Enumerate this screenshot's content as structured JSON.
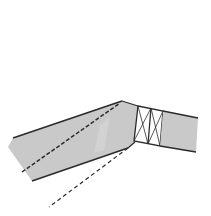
{
  "diagram": {
    "type": "technical-section",
    "width": 211,
    "height": 216,
    "colors": {
      "background": "#ffffff",
      "fill": "#c9c9c9",
      "highlight": "#d6d6d6",
      "stroke": "#2b2b2b",
      "dash": "#2b2b2b"
    },
    "shapes": {
      "angled_member": {
        "points": "13,138 122,101 138,106 135,142 128,148 32,181 8,147"
      },
      "highlight": {
        "points": "100,125 110,117 104,150 94,153"
      },
      "truss_panel": {
        "outer": "138,106 163,111 160,146 134,141",
        "mid_top": [
          151,
          108
        ],
        "mid_bottom": [
          148,
          144
        ]
      },
      "straight_member": {
        "points": "163,111 198,118 196,152 160,146"
      }
    },
    "dashed_lines": [
      {
        "x1": 22,
        "y1": 172,
        "x2": 120,
        "y2": 103
      },
      {
        "x1": 128,
        "y1": 148,
        "x2": 49,
        "y2": 207
      }
    ]
  }
}
